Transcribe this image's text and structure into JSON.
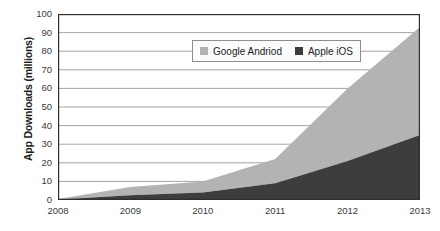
{
  "chart_data": {
    "type": "area",
    "stacked": true,
    "title": "",
    "xlabel": "",
    "ylabel": "App Downloads (millions)",
    "categories": [
      "2008",
      "2009",
      "2010",
      "2011",
      "2012",
      "2013"
    ],
    "x": [
      2008,
      2009,
      2010,
      2011,
      2012,
      2013
    ],
    "xlim": [
      2008,
      2013
    ],
    "ylim": [
      0,
      100
    ],
    "y_ticks": [
      0,
      10,
      20,
      30,
      40,
      50,
      60,
      70,
      80,
      90,
      100
    ],
    "x_ticks": [
      "2008",
      "2009",
      "2010",
      "2011",
      "2012",
      "2013"
    ],
    "grid": "horizontal",
    "legend_position": "top-center-inside",
    "series": [
      {
        "name": "Apple iOS",
        "color": "#3d3d3d",
        "values": [
          0.3,
          2.5,
          4,
          9,
          21,
          35
        ]
      },
      {
        "name": "Google Andriod",
        "color": "#b3b3b3",
        "values": [
          0.2,
          4.5,
          6,
          13,
          39,
          58
        ]
      }
    ],
    "stacked_totals": [
      0.5,
      7,
      10,
      22,
      60,
      93
    ]
  },
  "axes": {
    "y_title": "App Downloads (millions)",
    "y_tick_labels": [
      "100",
      "90",
      "80",
      "70",
      "60",
      "50",
      "40",
      "30",
      "20",
      "10",
      "0"
    ],
    "x_tick_labels": [
      "2008",
      "2009",
      "2010",
      "2011",
      "2012",
      "2013"
    ]
  },
  "legend": {
    "items": [
      {
        "label": "Google Andriod",
        "color": "#b3b3b3"
      },
      {
        "label": "Apple iOS",
        "color": "#3d3d3d"
      }
    ]
  },
  "colors": {
    "android": "#b3b3b3",
    "ios": "#3d3d3d",
    "grid": "#9a9a9a",
    "axis": "#2f2f2f",
    "plot_background": "#ffffff"
  }
}
